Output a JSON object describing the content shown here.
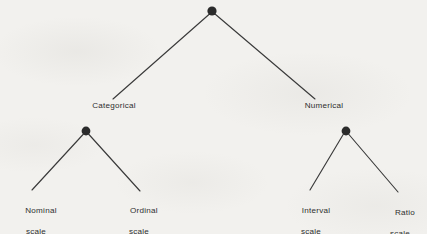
{
  "diagram": {
    "background_color": "#f2f1ee",
    "line_color": "#3a3a3a",
    "node_color": "#2b2b2b",
    "text_color": "#2e2e2e",
    "root": {
      "label": "",
      "x": 212,
      "y": 11,
      "radius": 4.6
    },
    "level1": [
      {
        "id": "categorical",
        "label": "Categorical",
        "text_x": 114,
        "text_y": 101,
        "branch": {
          "x1": 209.5,
          "y1": 14,
          "x2": 113,
          "y2": 99
        }
      },
      {
        "id": "numerical",
        "label": "Numerical",
        "text_x": 324,
        "text_y": 101,
        "branch": {
          "x1": 215,
          "y1": 14,
          "x2": 315,
          "y2": 99
        }
      }
    ],
    "level2_nodes": [
      {
        "id": "categorical-node",
        "x": 86,
        "y": 131,
        "radius": 4.4
      },
      {
        "id": "numerical-node",
        "x": 346,
        "y": 131,
        "radius": 4.4
      }
    ],
    "leaves": [
      {
        "id": "nominal-scale",
        "line1": "Nominal",
        "line2": "scale",
        "text_x": 36,
        "text_y": 196,
        "branch": {
          "x1": 83.5,
          "y1": 134,
          "x2": 32,
          "y2": 190
        }
      },
      {
        "id": "ordinal-scale",
        "line1": "Ordinal",
        "line2": "scale",
        "text_x": 139,
        "text_y": 196,
        "branch": {
          "x1": 88.5,
          "y1": 134,
          "x2": 140,
          "y2": 191
        }
      },
      {
        "id": "interval-scale",
        "line1": "Interval",
        "line2": "scale",
        "text_x": 311,
        "text_y": 196,
        "branch": {
          "x1": 343.5,
          "y1": 134,
          "x2": 310,
          "y2": 190
        }
      },
      {
        "id": "ratio-scale",
        "line1": "Ratio",
        "line2": "scale",
        "text_x": 400,
        "text_y": 198,
        "branch": {
          "x1": 348.5,
          "y1": 134,
          "x2": 398,
          "y2": 192
        }
      }
    ]
  }
}
